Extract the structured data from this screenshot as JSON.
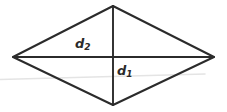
{
  "figure": {
    "type": "rhombus-diagram",
    "background_color": "#ffffff",
    "stroke_color": "#2b2b2b",
    "faint_stroke_color": "#e2e2e2",
    "labels": {
      "d2": {
        "base": "d",
        "sub": "2",
        "full": "d2"
      },
      "d1": {
        "base": "d",
        "sub": "1",
        "full": "d1"
      }
    }
  },
  "geometry": {
    "vertices": {
      "top": {
        "x": 113,
        "y": 6
      },
      "right": {
        "x": 214,
        "y": 57
      },
      "bottom": {
        "x": 113,
        "y": 105
      },
      "left": {
        "x": 13,
        "y": 57
      }
    },
    "diagonals": {
      "horizontal": {
        "x1": 13,
        "y1": 57,
        "x2": 214,
        "y2": 57,
        "label": "d2"
      },
      "vertical": {
        "x1": 113,
        "y1": 6,
        "x2": 113,
        "y2": 105,
        "label": "d1"
      }
    },
    "faint_line": {
      "x1": 0,
      "y1": 79,
      "x2": 205,
      "y2": 74
    }
  }
}
